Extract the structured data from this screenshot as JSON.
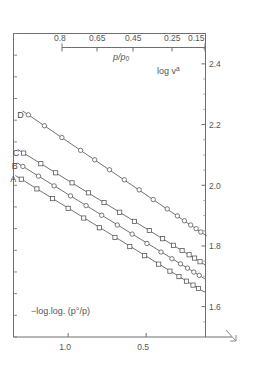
{
  "chart_data": {
    "type": "line",
    "title": "",
    "xlabel": "−log.log. (p°/p)",
    "ylabel": "log v",
    "ylabel_superscript": "a",
    "xlim": [
      1.35,
      0.12
    ],
    "ylim": [
      1.5,
      2.5
    ],
    "x_ticks": [
      1.0,
      0.5
    ],
    "x_tick_labels": [
      "1.0",
      "0.5"
    ],
    "y_ticks": [
      2.4,
      2.2,
      2.0,
      1.8,
      1.6
    ],
    "y_tick_labels": [
      "2.4",
      "2.2",
      "2.0",
      "1.8",
      "1.6"
    ],
    "grid": false,
    "legend": "inline-left-labels",
    "secondary_axis": {
      "label": "p/p₀",
      "position": "top",
      "tick_labels": [
        "0.8",
        "0.65",
        "0.45",
        "0.25",
        "0.15"
      ],
      "tick_values": [
        0.8,
        0.65,
        0.45,
        0.25,
        0.15
      ]
    },
    "series": [
      {
        "name": "D",
        "marker": "circle",
        "label": "D",
        "x": [
          1.255,
          1.152,
          1.04,
          0.92,
          0.83,
          0.735,
          0.64,
          0.545,
          0.455,
          0.365,
          0.3,
          0.255,
          0.215,
          0.18,
          0.15
        ],
        "y": [
          2.232,
          2.196,
          2.157,
          2.115,
          2.084,
          2.051,
          2.018,
          1.985,
          1.953,
          1.922,
          1.899,
          1.883,
          1.869,
          1.857,
          1.846
        ]
      },
      {
        "name": "C",
        "marker": "square",
        "label": "C",
        "x": [
          1.285,
          1.175,
          1.08,
          0.975,
          0.87,
          0.77,
          0.67,
          0.575,
          0.48,
          0.395,
          0.325,
          0.27,
          0.225,
          0.19,
          0.155
        ],
        "y": [
          2.106,
          2.071,
          2.041,
          2.008,
          1.975,
          1.943,
          1.911,
          1.881,
          1.851,
          1.824,
          1.802,
          1.785,
          1.771,
          1.76,
          1.748
        ]
      },
      {
        "name": "B",
        "marker": "circle",
        "label": "B",
        "x": [
          1.29,
          1.19,
          1.09,
          0.985,
          0.885,
          0.785,
          0.685,
          0.59,
          0.495,
          0.405,
          0.335,
          0.28,
          0.235,
          0.195,
          0.16
        ],
        "y": [
          2.062,
          2.03,
          1.998,
          1.965,
          1.933,
          1.901,
          1.869,
          1.839,
          1.808,
          1.78,
          1.758,
          1.741,
          1.727,
          1.714,
          1.703
        ]
      },
      {
        "name": "A",
        "marker": "square",
        "label": "A",
        "x": [
          1.3,
          1.2,
          1.1,
          1.0,
          0.9,
          0.8,
          0.7,
          0.605,
          0.51,
          0.42,
          0.348,
          0.29,
          0.242,
          0.2,
          0.165
        ],
        "y": [
          2.02,
          1.988,
          1.956,
          1.924,
          1.892,
          1.86,
          1.828,
          1.798,
          1.768,
          1.74,
          1.717,
          1.699,
          1.684,
          1.671,
          1.66
        ]
      }
    ]
  },
  "axes": {
    "secondary_label": "p/p",
    "secondary_label_sub": "0",
    "y_axis_label": "log v",
    "y_axis_label_sup": "a",
    "x_axis_label": "−log.log. (p°/p)"
  },
  "ticks": {
    "top": [
      "0.8",
      "0.65",
      "0.45",
      "0.25",
      "0.15"
    ],
    "right_y": [
      "2.4",
      "2.2",
      "2.0",
      "1.8",
      "1.6"
    ],
    "bottom_x": [
      "1.0",
      "0.5"
    ]
  },
  "series_labels": [
    "D",
    "C",
    "B",
    "A"
  ]
}
